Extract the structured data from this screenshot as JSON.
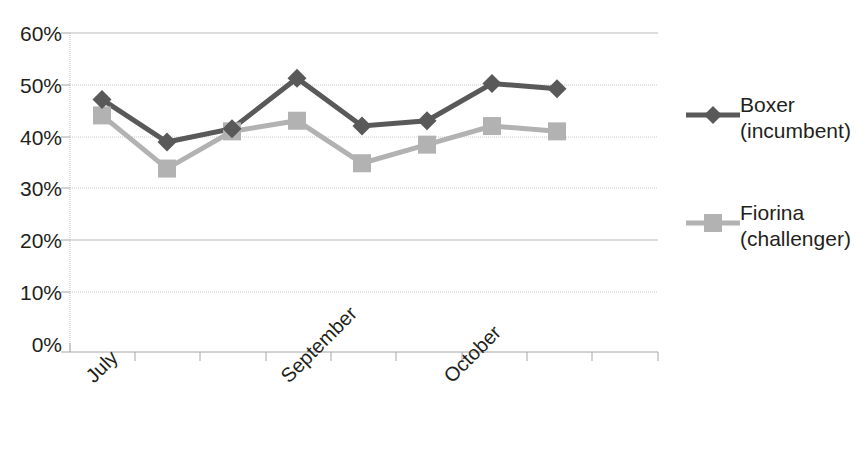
{
  "chart_data": {
    "type": "line",
    "title": "",
    "xlabel": "",
    "ylabel": "",
    "ylim": [
      0,
      60
    ],
    "yticks": [
      0,
      10,
      20,
      30,
      40,
      50,
      60
    ],
    "ytick_labels": [
      "0%",
      "10%",
      "20%",
      "30%",
      "40%",
      "50%",
      "60%"
    ],
    "grid": true,
    "legend_position": "right",
    "x": [
      1,
      2,
      3,
      4,
      5,
      6,
      7,
      8
    ],
    "xtick_labels": [
      "July",
      "September",
      "October"
    ],
    "xtick_label_positions": [
      1,
      4,
      6.5
    ],
    "series": [
      {
        "name": "Boxer",
        "sublabel": "(incumbent)",
        "legend_text": "Boxer (incumbent)",
        "color": "#595959",
        "marker": "diamond",
        "values": [
          47.5,
          39.5,
          42.0,
          51.5,
          42.5,
          43.5,
          50.5,
          49.5
        ]
      },
      {
        "name": "Fiorina",
        "sublabel": "(challenger)",
        "legend_text": "Fiorina (challenger)",
        "color": "#b2b2b2",
        "marker": "square",
        "values": [
          44.5,
          34.5,
          41.5,
          43.5,
          35.5,
          39.0,
          42.5,
          41.5
        ]
      }
    ]
  },
  "legend": {
    "entries": [
      {
        "name": "Boxer",
        "sub": "(incumbent)"
      },
      {
        "name": "Fiorina",
        "sub": "(challenger)"
      }
    ]
  },
  "axes": {
    "y_tick_labels": [
      "60%",
      "50%",
      "40%",
      "30%",
      "20%",
      "10%",
      "0%"
    ],
    "x_tick_labels": [
      "July",
      "September",
      "October"
    ]
  },
  "colors": {
    "series_boxer": "#595959",
    "series_fiorina": "#b2b2b2",
    "gridline": "#c9c9c9",
    "axis": "#a6a6a6",
    "text": "#231f20"
  }
}
